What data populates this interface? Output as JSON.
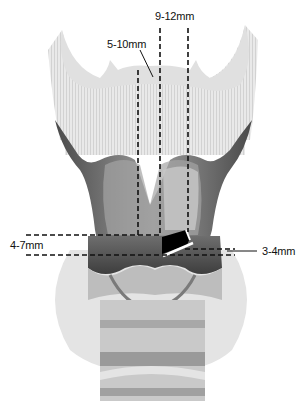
{
  "figure": {
    "labels": {
      "top_width": "9-12mm",
      "side_offset": "5-10mm",
      "window_height": "4-7mm",
      "lower_margin": "3-4mm"
    },
    "colors": {
      "background": "#ffffff",
      "cartilage_dark": "#5a5a5a",
      "cartilage_mid": "#8c8c8c",
      "tissue_light": "#d6d6d6",
      "window_fill": "#000000",
      "line": "#111111"
    }
  }
}
